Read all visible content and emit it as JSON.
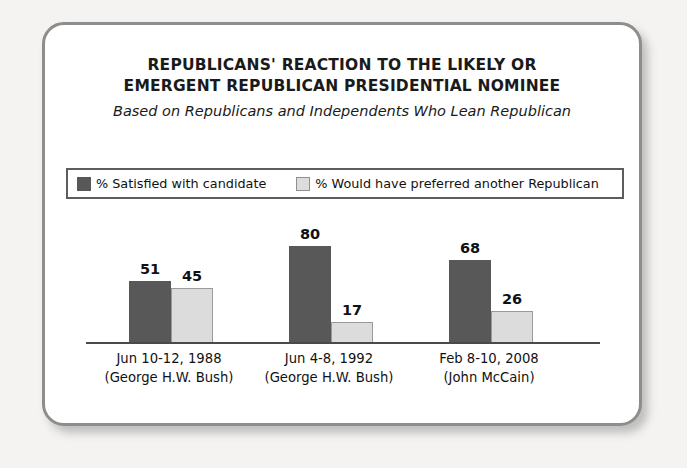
{
  "chart_data": {
    "type": "bar",
    "title": "REPUBLICANS' REACTION TO THE LIKELY OR EMERGENT REPUBLICAN PRESIDENTIAL NOMINEE",
    "title_lines": [
      "REPUBLICANS' REACTION TO THE LIKELY OR",
      "EMERGENT REPUBLICAN PRESIDENTIAL NOMINEE"
    ],
    "subtitle": "Based on Republicans and Independents Who Lean Republican",
    "categories": [
      "Jun 10-12, 1988",
      "Jun 4-8, 1992",
      "Feb 8-10, 2008"
    ],
    "category_sublabels": [
      "(George H.W. Bush)",
      "(George H.W. Bush)",
      "(John McCain)"
    ],
    "series": [
      {
        "name": "% Satisfied with candidate",
        "values": [
          51,
          80,
          68
        ],
        "color": "#585858"
      },
      {
        "name": "% Would have preferred another Republican",
        "values": [
          45,
          17,
          26
        ],
        "color": "#dcdcdc"
      }
    ],
    "ylim": [
      0,
      100
    ],
    "ylabel": "",
    "xlabel": "",
    "grid": false,
    "legend_position": "top",
    "axis_color": "#4a4a4a"
  },
  "frame": {
    "border_color": "#8d8d8d",
    "background": "#ffffff",
    "page_background": "#f4f3f1"
  }
}
